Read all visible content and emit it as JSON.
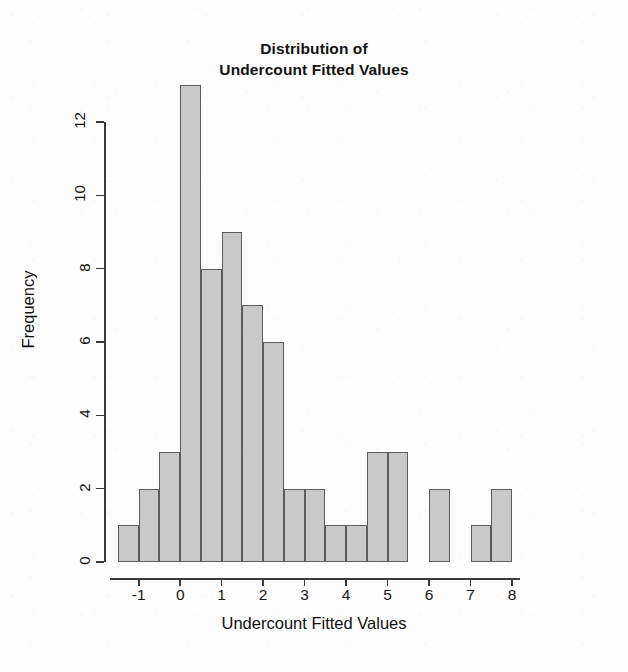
{
  "chart_data": {
    "type": "bar",
    "title": "Distribution of Undercount Fitted Values",
    "title_lines": [
      "Distribution of",
      "Undercount Fitted Values"
    ],
    "xlabel": "Undercount Fitted Values",
    "ylabel": "Frequency",
    "grid": false,
    "legend": null,
    "bin_width": 0.5,
    "xlim": [
      -1.5,
      8.0
    ],
    "ylim": [
      0,
      13
    ],
    "x_ticks": [
      -1,
      0,
      1,
      2,
      3,
      4,
      5,
      6,
      7,
      8
    ],
    "x_tick_labels": [
      "-1",
      "0",
      "1",
      "2",
      "3",
      "4",
      "5",
      "6",
      "7",
      "8"
    ],
    "y_ticks": [
      0,
      2,
      4,
      6,
      8,
      10,
      12
    ],
    "y_tick_labels": [
      "0",
      "2",
      "4",
      "6",
      "8",
      "10",
      "12"
    ],
    "bin_edges": [
      -1.5,
      -1.0,
      -0.5,
      0.0,
      0.5,
      1.0,
      1.5,
      2.0,
      2.5,
      3.0,
      3.5,
      4.0,
      4.5,
      5.0,
      5.5,
      6.0,
      6.5,
      7.0,
      7.5,
      8.0
    ],
    "categories": [
      "-1.5",
      "-1.0",
      "-0.5",
      "0.0",
      "0.5",
      "1.0",
      "1.5",
      "2.0",
      "2.5",
      "3.0",
      "3.5",
      "4.0",
      "4.5",
      "5.0",
      "5.5",
      "6.0",
      "6.5",
      "7.0",
      "7.5"
    ],
    "values": [
      1,
      2,
      3,
      13,
      8,
      9,
      7,
      6,
      2,
      2,
      1,
      1,
      3,
      3,
      0,
      2,
      0,
      1,
      2
    ],
    "bar_fill_color": "#c9c9c9",
    "bar_border_color": "#5c5c5c",
    "axis_color": "#3a3a3a",
    "background_color": "#fdfdfd"
  }
}
